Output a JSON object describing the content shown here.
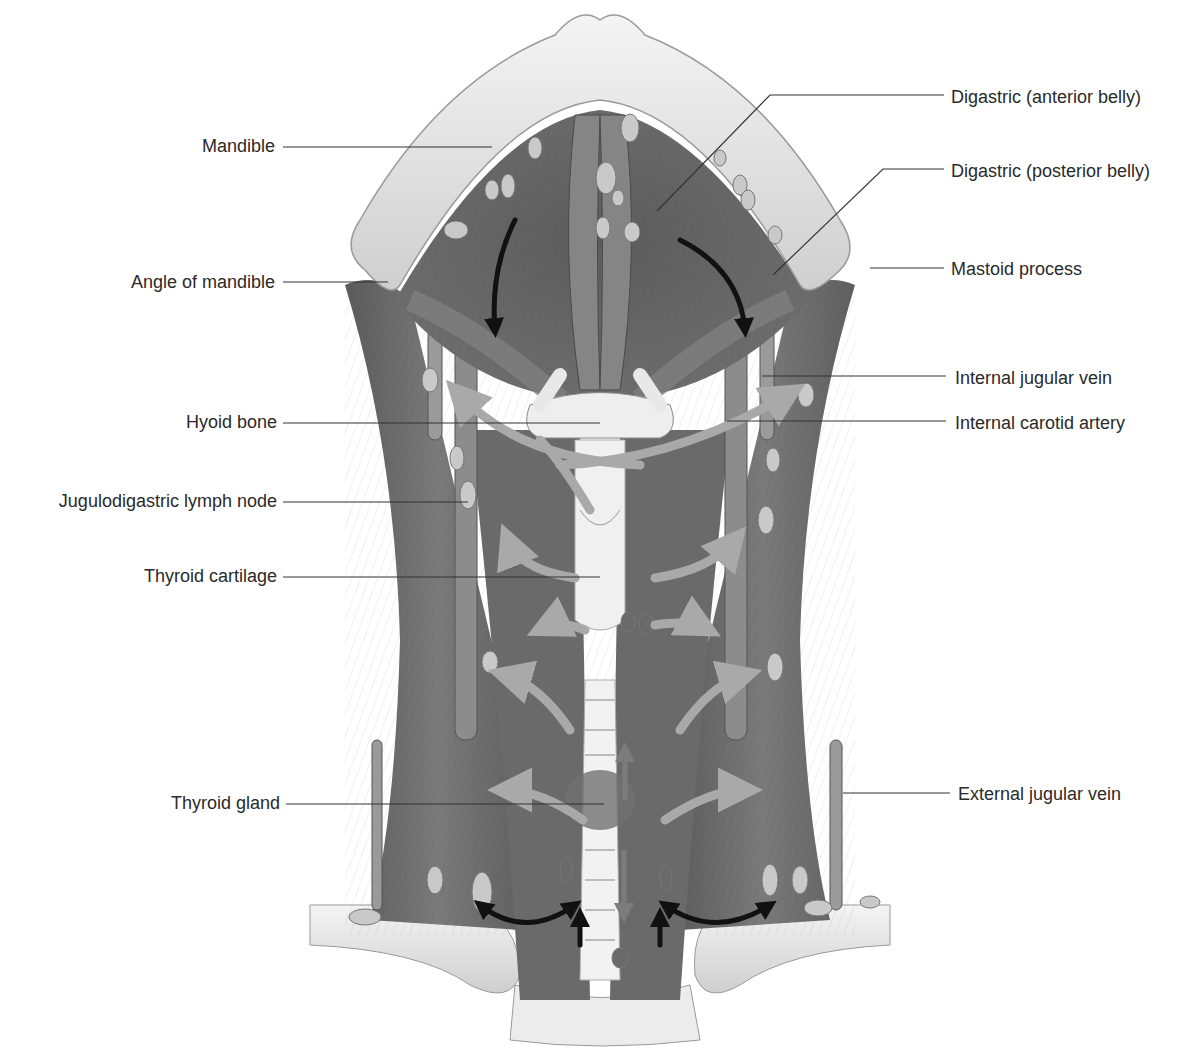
{
  "figure": {
    "colors": {
      "background": "#ffffff",
      "bone": "#e6e6e6",
      "bone_shadow": "#b8b8b8",
      "muscle": "#6e6e6e",
      "muscle_dark": "#4e4e4e",
      "muscle_light": "#8a8a8a",
      "lymph_node": "#c9c9c9",
      "cartilage": "#eeeeee",
      "arrow_light": "#a9a9a9",
      "arrow_dark": "#111111",
      "label_text": "#2a2a2a",
      "leader_line": "#333333"
    }
  },
  "labels": {
    "left": [
      {
        "id": "mandible",
        "text": "Mandible",
        "x": 275,
        "y": 145,
        "line_end": [
          492,
          147
        ]
      },
      {
        "id": "angle_of_mandible",
        "text": "Angle of mandible",
        "x": 275,
        "y": 281,
        "line_end": [
          388,
          282
        ]
      },
      {
        "id": "hyoid_bone",
        "text": "Hyoid bone",
        "x": 277,
        "y": 421,
        "line_end": [
          600,
          423
        ]
      },
      {
        "id": "jugulodigastric_lymph_node",
        "text": "Jugulodigastric lymph node",
        "x": 277,
        "y": 500,
        "line_end": [
          468,
          502
        ]
      },
      {
        "id": "thyroid_cartilage",
        "text": "Thyroid cartilage",
        "x": 277,
        "y": 575,
        "line_end": [
          600,
          577
        ]
      },
      {
        "id": "thyroid_gland",
        "text": "Thyroid gland",
        "x": 280,
        "y": 802,
        "line_end": [
          604,
          804
        ]
      }
    ],
    "right": [
      {
        "id": "digastric_anterior_belly",
        "text": "Digastric (anterior belly)",
        "x": 951,
        "y": 96,
        "line_start": [
          657,
          211
        ],
        "elbow": [
          770,
          95
        ]
      },
      {
        "id": "digastric_posterior_belly",
        "text": "Digastric (posterior belly)",
        "x": 951,
        "y": 170,
        "line_start": [
          773,
          275
        ],
        "elbow": [
          883,
          169
        ]
      },
      {
        "id": "mastoid_process",
        "text": "Mastoid process",
        "x": 951,
        "y": 268,
        "line_start": [
          870,
          268
        ]
      },
      {
        "id": "internal_jugular_vein",
        "text": "Internal jugular vein",
        "x": 955,
        "y": 377,
        "line_start": [
          762,
          376
        ]
      },
      {
        "id": "internal_carotid_artery",
        "text": "Internal carotid artery",
        "x": 955,
        "y": 422,
        "line_start": [
          727,
          421
        ]
      },
      {
        "id": "external_jugular_vein",
        "text": "External jugular vein",
        "x": 958,
        "y": 793,
        "line_start": [
          843,
          793
        ]
      }
    ]
  }
}
